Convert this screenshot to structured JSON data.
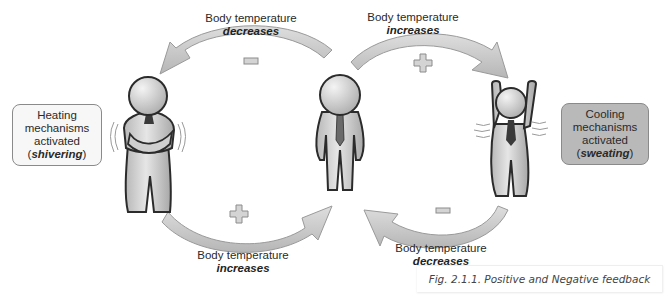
{
  "figure": {
    "caption": "Fig. 2.1.1. Positive and Negative feedback",
    "arrows": [
      {
        "id": "top-left",
        "line1": "Body temperature",
        "line2": "decreases",
        "sign": "minus",
        "direction": "leftward"
      },
      {
        "id": "top-right",
        "line1": "Body temperature",
        "line2": "increases",
        "sign": "plus",
        "direction": "rightward"
      },
      {
        "id": "bottom-left",
        "line1": "Body temperature",
        "line2": "increases",
        "sign": "plus",
        "direction": "rightward"
      },
      {
        "id": "bottom-right",
        "line1": "Body temperature",
        "line2": "decreases",
        "sign": "minus",
        "direction": "leftward"
      }
    ],
    "boxes": {
      "heating": {
        "line1": "Heating",
        "line2": "mechanisms",
        "line3": "activated",
        "open": "(",
        "emph": "shivering",
        "close": ")"
      },
      "cooling": {
        "line1": "Cooling",
        "line2": "mechanisms",
        "line3": "activated",
        "open": "(",
        "emph": "sweating",
        "close": ")"
      }
    },
    "figures": [
      "shivering-person",
      "neutral-person",
      "sweating-person"
    ],
    "colors": {
      "arrow_fill": "#c4c4c4",
      "arrow_stroke": "#9a9a9a",
      "figure_body": "#d0d0d0",
      "figure_outline": "#2b2b2b",
      "tie": "#5a5a5a",
      "cool_box": "#b9b9b9",
      "heat_box": "#f7f7f7"
    }
  }
}
